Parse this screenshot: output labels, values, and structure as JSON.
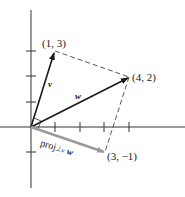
{
  "diagram": {
    "type": "vector-projection",
    "axes": {
      "origin": [
        0,
        0
      ],
      "x_ticks": [
        1,
        2,
        3,
        4
      ],
      "y_ticks": [
        -1,
        1,
        2,
        3
      ]
    },
    "points": {
      "v_tip": "(1, 3)",
      "w_tip": "(4, 2)",
      "proj_tip": "(3, −1)"
    },
    "vectors": [
      {
        "name": "v",
        "from": [
          0,
          0
        ],
        "to": [
          1,
          3
        ],
        "color": "#1a1a1a"
      },
      {
        "name": "w",
        "from": [
          0,
          0
        ],
        "to": [
          4,
          2
        ],
        "color": "#1a1a1a"
      },
      {
        "name": "proj⊥v w",
        "from": [
          0,
          0
        ],
        "to": [
          3,
          -1
        ],
        "color": "#9a9a9a"
      }
    ],
    "labels": {
      "v": "v",
      "w": "w",
      "proj_main": "proj",
      "proj_sub": "⊥v",
      "proj_arg": "w"
    }
  }
}
